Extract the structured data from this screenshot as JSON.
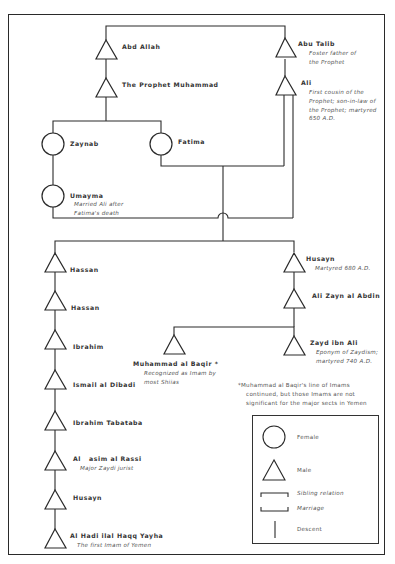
{
  "diagram": {
    "people": {
      "abd_allah": {
        "name": "Abd Allah",
        "sex": "male"
      },
      "muhammad": {
        "name": "The Prophet Muhammad",
        "sex": "male"
      },
      "abu_talib": {
        "name": "Abu Talib",
        "sex": "male",
        "note": "Foster father of\nthe Prophet"
      },
      "ali": {
        "name": "Ali",
        "sex": "male",
        "note": "First cousin of the\nProphet; son-in-law of\nthe Prophet; martyred\n650 A.D."
      },
      "zaynab": {
        "name": "Zaynab",
        "sex": "female"
      },
      "fatima": {
        "name": "Fatima",
        "sex": "female"
      },
      "umayma": {
        "name": "Umayma",
        "sex": "female",
        "note": "Married Ali after\nFatima's death"
      },
      "hassan1": {
        "name": "Hassan",
        "sex": "male"
      },
      "hassan2": {
        "name": "Hassan",
        "sex": "male"
      },
      "ibrahim": {
        "name": "Ibrahim",
        "sex": "male"
      },
      "ismail": {
        "name": "Ismail al Dibadi",
        "sex": "male"
      },
      "ibrahim_tabataba": {
        "name": "Ibrahim Tabataba",
        "sex": "male"
      },
      "al_qasim": {
        "name": "Al   asim al Rassi",
        "sex": "male",
        "note": "Major Zaydi jurist"
      },
      "husayn_lower": {
        "name": "Husayn",
        "sex": "male"
      },
      "al_hadi": {
        "name": "Al Hadi ilal Haqq Yayha",
        "sex": "male",
        "note": "The first Imam of Yemen"
      },
      "husayn": {
        "name": "Husayn",
        "sex": "male",
        "note": "Martyred 680 A.D."
      },
      "ali_zayn": {
        "name": "Ali Zayn al Abdin",
        "sex": "male"
      },
      "muhammad_baqir": {
        "name": "Muhammad al Baqir *",
        "sex": "male",
        "note": "Recognized as Imam by\nmost Shiias"
      },
      "zayd": {
        "name": "Zayd ibn Ali",
        "sex": "male",
        "note": "Eponym of Zaydism;\nmartyred 740 A.D."
      }
    },
    "footnote": "*Muhammad al Baqir's line of Imams\n    continued, but those Imams are not\n    significant for the major sects in Yemen",
    "legend": {
      "female": "Female",
      "male": "Male",
      "sibling": "Sibling relation",
      "marriage": "Marriage",
      "descent": "Descent"
    },
    "colors": {
      "ink": "#2a2a2a",
      "paper": "#ffffff",
      "note": "#555555"
    }
  }
}
